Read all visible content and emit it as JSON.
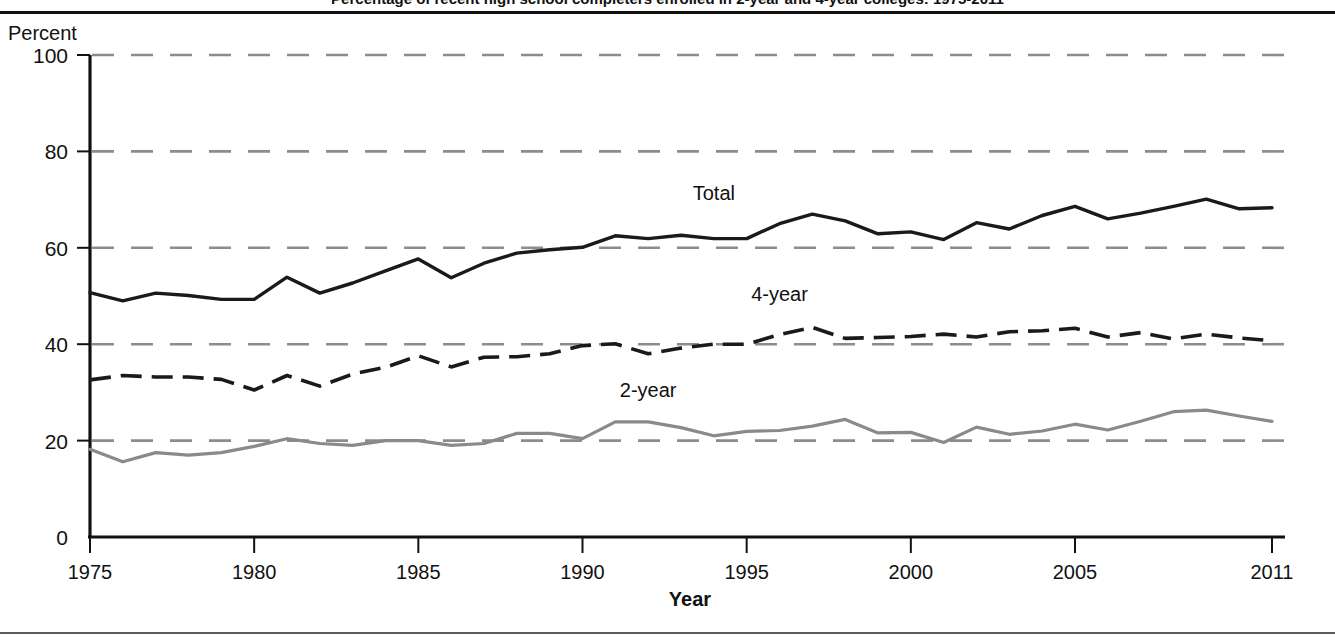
{
  "figure": {
    "title": "Percentage of recent high school completers enrolled in 2-year and 4-year colleges: 1975-2011",
    "unit_label": "Percent"
  },
  "chart_data": {
    "type": "line",
    "title": "Percentage of recent high school completers enrolled in 2-year and 4-year colleges: 1975-2011",
    "xlabel": "Year",
    "ylabel": "Percent",
    "xlim": [
      1975,
      2011
    ],
    "ylim": [
      0,
      100
    ],
    "grid": "horizontal-dashed",
    "legend": "inline-labels",
    "x": [
      1975,
      1976,
      1977,
      1978,
      1979,
      1980,
      1981,
      1982,
      1983,
      1984,
      1985,
      1986,
      1987,
      1988,
      1989,
      1990,
      1991,
      1992,
      1993,
      1994,
      1995,
      1996,
      1997,
      1998,
      1999,
      2000,
      2001,
      2002,
      2003,
      2004,
      2005,
      2006,
      2007,
      2008,
      2009,
      2010,
      2011
    ],
    "xticks": [
      1975,
      1980,
      1985,
      1990,
      1995,
      2000,
      2005,
      2011
    ],
    "yticks": [
      0,
      20,
      40,
      60,
      80,
      100
    ],
    "series": [
      {
        "name": "Total",
        "label": "Total",
        "style": "solid",
        "color": "#1a1a1a",
        "label_x": 1994,
        "label_y": 70,
        "values": [
          50.7,
          49.0,
          50.6,
          50.1,
          49.3,
          49.3,
          53.9,
          50.6,
          52.7,
          55.2,
          57.7,
          53.8,
          56.8,
          58.9,
          59.6,
          60.1,
          62.5,
          61.9,
          62.6,
          61.9,
          61.9,
          65.0,
          67.0,
          65.6,
          62.9,
          63.3,
          61.7,
          65.2,
          63.9,
          66.7,
          68.6,
          66.0,
          67.2,
          68.6,
          70.1,
          68.1,
          68.3
        ]
      },
      {
        "name": "4-year",
        "label": "4-year",
        "style": "dashed",
        "color": "#1a1a1a",
        "label_x": 1996,
        "label_y": 49,
        "values": [
          32.6,
          33.5,
          33.2,
          33.2,
          32.7,
          30.5,
          33.5,
          31.3,
          33.8,
          35.2,
          37.6,
          35.3,
          37.3,
          37.4,
          38.0,
          39.7,
          40.1,
          38.0,
          39.2,
          40.0,
          40.0,
          42.0,
          43.5,
          41.2,
          41.4,
          41.6,
          42.1,
          41.5,
          42.6,
          42.8,
          43.3,
          41.5,
          42.4,
          41.1,
          42.1,
          41.3,
          40.7
        ]
      },
      {
        "name": "2-year",
        "label": "2-year",
        "style": "solid",
        "color": "#8a8a8a",
        "label_x": 1992,
        "label_y": 29,
        "values": [
          18.2,
          15.6,
          17.5,
          17.0,
          17.5,
          18.8,
          20.4,
          19.4,
          19.0,
          20.0,
          20.0,
          19.0,
          19.4,
          21.5,
          21.5,
          20.4,
          23.9,
          23.9,
          22.7,
          21.0,
          21.9,
          22.1,
          23.0,
          24.4,
          21.6,
          21.7,
          19.6,
          22.8,
          21.3,
          22.0,
          23.4,
          22.2,
          24.0,
          26.0,
          26.3,
          25.1,
          24.0
        ]
      }
    ]
  }
}
